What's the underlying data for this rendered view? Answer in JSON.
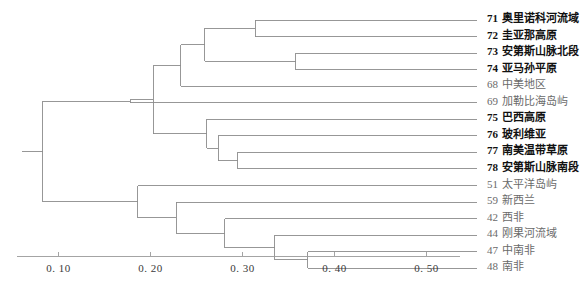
{
  "chart_data": {
    "type": "dendrogram",
    "title": "",
    "xlabel": "",
    "ylabel": "",
    "xlim": [
      0.055,
      0.555
    ],
    "grid": false,
    "legend": null,
    "axis": {
      "ticks": [
        0.1,
        0.2,
        0.3,
        0.4,
        0.5
      ],
      "tick_labels": [
        "0. 10",
        "0. 20",
        "0. 30",
        "0. 40",
        "0. 50"
      ],
      "orientation": "bottom"
    },
    "leaves": [
      {
        "id": "71",
        "label": "奥里诺科河流域",
        "emphasis": "bold",
        "height": 0.555
      },
      {
        "id": "72",
        "label": "圭亚那高原",
        "emphasis": "bold",
        "height": 0.555
      },
      {
        "id": "73",
        "label": "安第斯山脉北段",
        "emphasis": "bold",
        "height": 0.555
      },
      {
        "id": "74",
        "label": "亚马孙平原",
        "emphasis": "bold",
        "height": 0.555
      },
      {
        "id": "68",
        "label": "中美地区",
        "emphasis": "light",
        "height": 0.555
      },
      {
        "id": "69",
        "label": "加勒比海岛屿",
        "emphasis": "light",
        "height": 0.555
      },
      {
        "id": "75",
        "label": "巴西高原",
        "emphasis": "bold",
        "height": 0.555
      },
      {
        "id": "76",
        "label": "玻利维亚",
        "emphasis": "bold",
        "height": 0.555
      },
      {
        "id": "77",
        "label": "南美温带草原",
        "emphasis": "bold",
        "height": 0.555
      },
      {
        "id": "78",
        "label": "安第斯山脉南段",
        "emphasis": "bold",
        "height": 0.555
      },
      {
        "id": "51",
        "label": "太平洋岛屿",
        "emphasis": "light",
        "height": 0.555
      },
      {
        "id": "59",
        "label": "新西兰",
        "emphasis": "light",
        "height": 0.555
      },
      {
        "id": "42",
        "label": "西非",
        "emphasis": "light",
        "height": 0.555
      },
      {
        "id": "44",
        "label": "刚果河流域",
        "emphasis": "light",
        "height": 0.555
      },
      {
        "id": "47",
        "label": "中南非",
        "emphasis": "light",
        "height": 0.555
      },
      {
        "id": "48",
        "label": "南非",
        "emphasis": "light",
        "height": 0.555
      }
    ],
    "merges": [
      {
        "name": "n71_72",
        "children": [
          "71",
          "72"
        ],
        "distance": 0.314
      },
      {
        "name": "n73_74",
        "children": [
          "73",
          "74"
        ],
        "distance": 0.358
      },
      {
        "name": "nA",
        "children": [
          "n71_72",
          "n73_74"
        ],
        "distance": 0.259
      },
      {
        "name": "nB",
        "children": [
          "nA",
          "68"
        ],
        "distance": 0.233
      },
      {
        "name": "n77_78",
        "children": [
          "77",
          "78"
        ],
        "distance": 0.295
      },
      {
        "name": "n76",
        "children": [
          "76",
          "n77_78"
        ],
        "distance": 0.274
      },
      {
        "name": "n75",
        "children": [
          "75",
          "n76"
        ],
        "distance": 0.261
      },
      {
        "name": "nC",
        "children": [
          "nB",
          "n75"
        ],
        "distance": 0.203
      },
      {
        "name": "nD",
        "children": [
          "nC",
          "69"
        ],
        "distance": 0.178
      },
      {
        "name": "n47_48",
        "children": [
          "47",
          "48"
        ],
        "distance": 0.371
      },
      {
        "name": "n44",
        "children": [
          "44",
          "n47_48"
        ],
        "distance": 0.335
      },
      {
        "name": "n42",
        "children": [
          "42",
          "n44"
        ],
        "distance": 0.281
      },
      {
        "name": "n59",
        "children": [
          "59",
          "n42"
        ],
        "distance": 0.228
      },
      {
        "name": "nE",
        "children": [
          "51",
          "n59"
        ],
        "distance": 0.186
      },
      {
        "name": "root",
        "children": [
          "nD",
          "nE"
        ],
        "distance": 0.083
      }
    ],
    "leaf_order": [
      "71",
      "72",
      "73",
      "74",
      "68",
      "69",
      "75",
      "76",
      "77",
      "78",
      "51",
      "59",
      "42",
      "44",
      "47",
      "48"
    ],
    "root_stub_to": 0.06,
    "line_color": "#8c8c8c",
    "axis_color": "#9a9a9a"
  }
}
